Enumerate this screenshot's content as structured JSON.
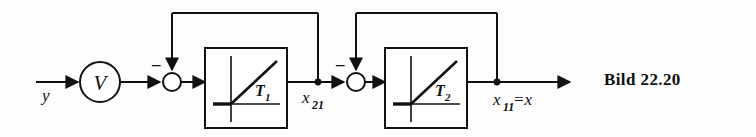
{
  "figure": {
    "caption": "Bild 22.20",
    "background_color": "#fdfdfd",
    "line_color": "#111111"
  },
  "signals": {
    "input_label": "y",
    "intermediate_label": "x",
    "intermediate_sub": "21",
    "output_label": "x",
    "output_sub": "11",
    "output_eq": "=x"
  },
  "amplifier": {
    "label": "V",
    "shape": "circle"
  },
  "summing_junctions": [
    {
      "name": "sum-1",
      "negative_sign": "–",
      "shape": "circle"
    },
    {
      "name": "sum-2",
      "negative_sign": "–",
      "shape": "circle"
    }
  ],
  "blocks": [
    {
      "name": "block-t1",
      "label": "T",
      "sub": "1",
      "glyph": "ramp-response"
    },
    {
      "name": "block-t2",
      "label": "T",
      "sub": "2",
      "glyph": "ramp-response"
    }
  ],
  "feedback_loops": [
    {
      "name": "feedback-loop-1",
      "sign": "negative"
    },
    {
      "name": "feedback-loop-2",
      "sign": "negative"
    }
  ]
}
